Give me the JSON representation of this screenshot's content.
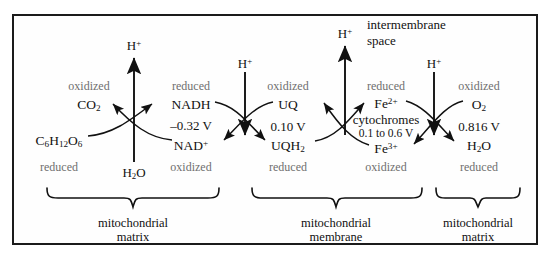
{
  "figure": {
    "border_color": "#1b1b1b",
    "background": "#fefefe",
    "label_color_dark": "#111111",
    "label_color_gray": "#6f6f6f"
  },
  "regions": {
    "intermembrane": {
      "line1": "intermembrane",
      "line2": "space"
    },
    "braces": [
      {
        "line1": "mitochondrial",
        "line2": "matrix"
      },
      {
        "line1": "mitochondrial",
        "line2": "membrane"
      },
      {
        "line1": "mitochondrial",
        "line2": "matrix"
      }
    ]
  },
  "protons": [
    {
      "id": "h-1",
      "label": "H",
      "charge": "+",
      "direction": "up"
    },
    {
      "id": "h-2",
      "label": "H",
      "charge": "+",
      "direction": "down"
    },
    {
      "id": "h-3",
      "label": "H",
      "charge": "+",
      "direction": "up"
    },
    {
      "id": "h-4",
      "label": "H",
      "charge": "+",
      "direction": "down"
    }
  ],
  "water_label": {
    "formula": "H",
    "sub": "2",
    "tail": "O"
  },
  "couples": [
    {
      "id": "couple-glucose-nad",
      "left_top_state": "oxidized",
      "left_top_species": "CO",
      "left_top_sub": "2",
      "left_bottom_species": "C6H12O6",
      "left_bottom_state": "reduced",
      "right_top_state": "reduced",
      "right_top_species": "NADH",
      "right_bottom_species": "NAD",
      "right_bottom_sup": "+",
      "right_bottom_state": "oxidized",
      "potential": "–0.32 V"
    },
    {
      "id": "couple-uq",
      "right_top_state": "oxidized",
      "right_top_species": "UQ",
      "right_bottom_species": "UQH",
      "right_bottom_sub": "2",
      "right_bottom_state": "reduced",
      "potential": "0.10 V"
    },
    {
      "id": "couple-cytochrome",
      "right_top_state": "reduced",
      "right_top_species": "Fe",
      "right_top_sup": "2+",
      "right_bottom_species": "Fe",
      "right_bottom_sup": "3+",
      "right_bottom_state": "oxidized",
      "carrier_name": "cytochromes",
      "potential": "0.1 to 0.6 V"
    },
    {
      "id": "couple-oxygen",
      "right_top_state": "oxidized",
      "right_top_species": "O",
      "right_top_sub": "2",
      "right_bottom_species": "H",
      "right_bottom_sub": "2",
      "right_bottom_tail": "O",
      "right_bottom_state": "reduced",
      "potential": "0.816 V"
    }
  ]
}
